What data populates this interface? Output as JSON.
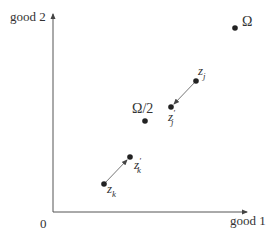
{
  "diagram": {
    "axes": {
      "x_label": "good 1",
      "y_label": "good 2",
      "origin_label": "0"
    },
    "points": [
      {
        "id": "Omega",
        "label": "Ω",
        "x": 235,
        "y": 28
      },
      {
        "id": "Omega_half",
        "label": "Ω/2",
        "x": 145,
        "y": 121
      },
      {
        "id": "z_j",
        "label": "z",
        "sub": "j",
        "x": 196,
        "y": 81
      },
      {
        "id": "z_j_prime",
        "label": "z",
        "sub": "j",
        "sup": "′",
        "x": 171,
        "y": 107
      },
      {
        "id": "z_k",
        "label": "z",
        "sub": "k",
        "x": 104,
        "y": 184
      },
      {
        "id": "z_k_prime",
        "label": "z",
        "sub": "k",
        "sup": "′",
        "x": 130,
        "y": 157
      }
    ],
    "arrows": [
      {
        "from": "z_j",
        "to": "z_j_prime"
      },
      {
        "from": "z_k",
        "to": "z_k_prime"
      }
    ],
    "colors": {
      "ink": "#333333",
      "line": "#555555"
    }
  }
}
